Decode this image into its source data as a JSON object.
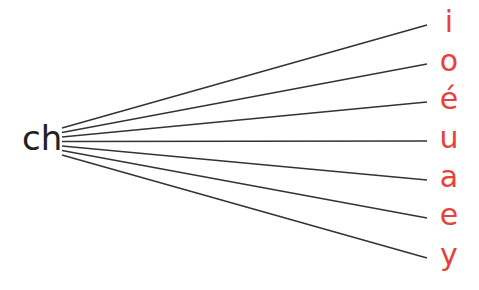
{
  "diagram": {
    "source": {
      "label": "ch",
      "color": "#222222"
    },
    "target_color": "#e8413a",
    "line_color": "#333333",
    "targets": [
      {
        "label": "i",
        "y": 25
      },
      {
        "label": "o",
        "y": 64
      },
      {
        "label": "é",
        "y": 102
      },
      {
        "label": "u",
        "y": 141
      },
      {
        "label": "a",
        "y": 180
      },
      {
        "label": "e",
        "y": 218
      },
      {
        "label": "y",
        "y": 258
      }
    ]
  }
}
